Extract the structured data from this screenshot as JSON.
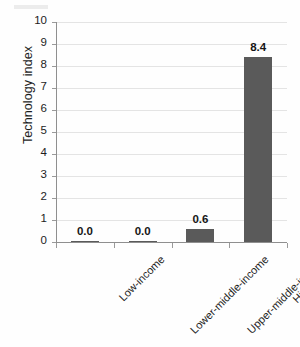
{
  "chart_data": {
    "type": "bar",
    "title": "",
    "subtitle": "",
    "xlabel": "",
    "ylabel": "Technology index",
    "categories": [
      "Low-income",
      "Lower-middle-income",
      "Upper-middle-income",
      "High-income"
    ],
    "values": [
      0.0,
      0.0,
      0.6,
      8.4
    ],
    "data_labels": [
      "0.0",
      "0.0",
      "0.6",
      "8.4"
    ],
    "ylim": [
      0,
      10
    ],
    "ytick_labels": [
      "10",
      "9",
      "8",
      "7",
      "6",
      "5",
      "4",
      "3",
      "2",
      "1",
      "0"
    ],
    "ytick_values": [
      10,
      9,
      8,
      7,
      6,
      5,
      4,
      3,
      2,
      1,
      0
    ],
    "grid": true,
    "grid_axis": "y",
    "legend": "none",
    "series": [
      {
        "name": "Technology index",
        "values": [
          0.0,
          0.0,
          0.6,
          8.4
        ]
      }
    ]
  },
  "style": {
    "bar_color": "#5a5a5a",
    "grid_color": "#e4e4e4",
    "axis_color": "#8f8f8f",
    "text_color": "#1d1d1d",
    "background": "#fefefe"
  }
}
